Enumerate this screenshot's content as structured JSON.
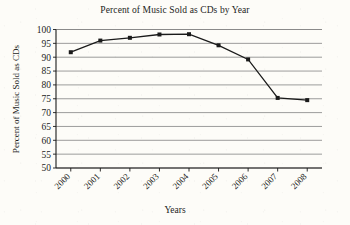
{
  "chart_data": {
    "type": "line",
    "title": "Percent of Music Sold as CDs by Year",
    "xlabel": "Years",
    "ylabel": "Percent of Music Sold as CDs",
    "categories": [
      "2000",
      "2001",
      "2002",
      "2003",
      "2004",
      "2005",
      "2006",
      "2007",
      "2008"
    ],
    "values": [
      91.8,
      96.0,
      97.0,
      98.2,
      98.3,
      94.3,
      89.2,
      75.3,
      74.5
    ],
    "ylim": [
      50,
      100
    ],
    "ytick_step": 5,
    "yticks": [
      "100",
      "95",
      "90",
      "85",
      "80",
      "75",
      "70",
      "65",
      "60",
      "55",
      "50"
    ],
    "grid": true,
    "grid_axis": "y",
    "legend": "none",
    "marker": "filled-square",
    "line_color": "#1a1a1a",
    "grid_color": "#8a8a8a",
    "axis_color": "#1a1a1a",
    "background_color": "#fdfcf8"
  }
}
